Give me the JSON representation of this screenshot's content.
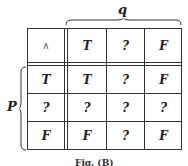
{
  "labels": {
    "column_variable": "q",
    "row_variable": "P"
  },
  "table": {
    "operator": "∧",
    "column_headers": [
      "T",
      "?",
      "F"
    ],
    "rows": [
      {
        "header": "T",
        "cells": [
          "T",
          "?",
          "F"
        ]
      },
      {
        "header": "?",
        "cells": [
          "?",
          "?",
          "?"
        ]
      },
      {
        "header": "F",
        "cells": [
          "F",
          "?",
          "F"
        ]
      }
    ]
  },
  "caption": "Fig. (B)"
}
